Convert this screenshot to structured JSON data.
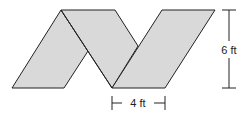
{
  "diagram": {
    "shape": "net of three parallelograms (zigzag)",
    "fill_color": "#d9d9d9",
    "stroke_color": "#222222",
    "labels": {
      "height": "6 ft",
      "base": "4 ft"
    }
  }
}
